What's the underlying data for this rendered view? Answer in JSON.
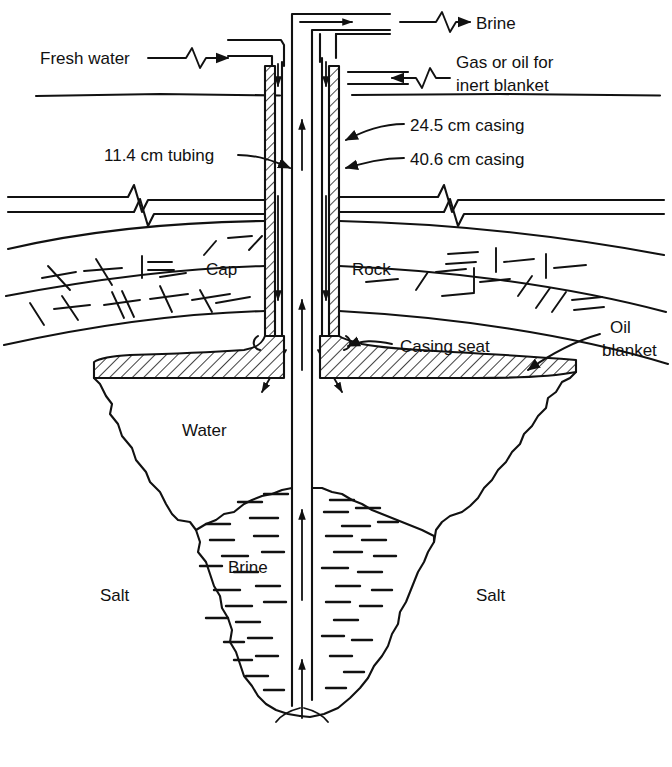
{
  "figure": {
    "kind": "engineering-diagram"
  },
  "labels": {
    "fresh_water": "Fresh water",
    "brine_out": "Brine",
    "gas_or_oil_line1": "Gas or oil for",
    "gas_or_oil_line2": "inert blanket",
    "tubing": "11.4 cm tubing",
    "casing_inner": "24.5 cm casing",
    "casing_outer": "40.6 cm casing",
    "cap": "Cap",
    "rock": "Rock",
    "casing_seat": "Casing seat",
    "oil_blanket_line1": "Oil",
    "oil_blanket_line2": "blanket",
    "water": "Water",
    "brine_cavern": "Brine",
    "salt_left": "Salt",
    "salt_right": "Salt"
  },
  "dimensions": {
    "tubing_diameter": "11.4 cm",
    "inner_casing_diameter": "24.5 cm",
    "outer_casing_diameter": "40.6 cm"
  },
  "flows": [
    {
      "name": "fresh-water-in",
      "label": "Fresh water",
      "direction": "into-well"
    },
    {
      "name": "brine-out",
      "label": "Brine",
      "direction": "out-of-well"
    },
    {
      "name": "inert-blanket-in",
      "label": "Gas or oil for inert blanket",
      "direction": "into-well"
    }
  ],
  "strata": [
    {
      "name": "overburden",
      "label": ""
    },
    {
      "name": "cap-rock",
      "label": "Cap"
    },
    {
      "name": "rock",
      "label": "Rock"
    },
    {
      "name": "salt",
      "label": "Salt"
    }
  ],
  "colors": {
    "ink": "#111111",
    "paper": "#ffffff"
  }
}
